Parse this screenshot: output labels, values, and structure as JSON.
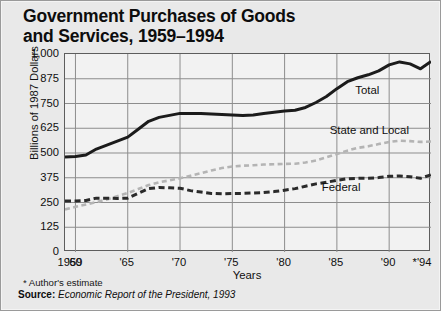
{
  "title": "Government Purchases of Goods\nand Services, 1959–1994",
  "footnote": "* Author's estimate",
  "source": {
    "key": "Source:",
    "value": "Economic Report of the President, 1993"
  },
  "labels": {
    "total": "Total",
    "state_and_local": "State and Local",
    "federal": "Federal"
  },
  "colors": {
    "total": "#1b1b1b",
    "state_and_local": "#b4b4b4",
    "federal": "#2a2a2a",
    "grid": "#8d8d8d",
    "frame": "#5d5d5d",
    "panel": "#e9e9e9",
    "plot": "#f2f2f2"
  },
  "chart_data": {
    "type": "line",
    "title": "Government Purchases of Goods and Services, 1959–1994",
    "xlabel": "Years",
    "ylabel": "Billions of 1987 Dollars",
    "ylim": [
      0,
      1000
    ],
    "yticks": [
      "0",
      "125",
      "250",
      "375",
      "500",
      "625",
      "750",
      "875",
      "1,000"
    ],
    "ytick_values": [
      0,
      125,
      250,
      375,
      500,
      625,
      750,
      875,
      1000
    ],
    "xlim": [
      1959,
      1994
    ],
    "xticks": [
      "1959",
      "'60",
      "'65",
      "'70",
      "'75",
      "'80",
      "'85",
      "'90",
      "*'94"
    ],
    "xtick_values": [
      1959,
      1960,
      1965,
      1970,
      1975,
      1980,
      1985,
      1990,
      1994
    ],
    "grid": true,
    "legend": "inline-labels",
    "x": [
      1959,
      1960,
      1961,
      1962,
      1963,
      1964,
      1965,
      1966,
      1967,
      1968,
      1969,
      1970,
      1971,
      1972,
      1973,
      1974,
      1975,
      1976,
      1977,
      1978,
      1979,
      1980,
      1981,
      1982,
      1983,
      1984,
      1985,
      1986,
      1987,
      1988,
      1989,
      1990,
      1991,
      1992,
      1993,
      1994
    ],
    "series": [
      {
        "name": "Total",
        "style": "solid",
        "values": [
          480,
          482,
          490,
          520,
          540,
          560,
          580,
          620,
          660,
          680,
          690,
          700,
          700,
          700,
          697,
          695,
          692,
          690,
          692,
          700,
          706,
          712,
          716,
          730,
          755,
          785,
          825,
          860,
          880,
          895,
          915,
          945,
          960,
          950,
          925,
          962
        ]
      },
      {
        "name": "State and Local",
        "style": "dashed-light",
        "values": [
          215,
          228,
          240,
          252,
          265,
          282,
          298,
          318,
          338,
          352,
          362,
          372,
          385,
          398,
          412,
          424,
          432,
          436,
          438,
          442,
          443,
          445,
          446,
          452,
          462,
          478,
          495,
          512,
          526,
          534,
          545,
          556,
          562,
          560,
          556,
          558
        ]
      },
      {
        "name": "Federal",
        "style": "dashed-dark",
        "values": [
          258,
          258,
          260,
          272,
          272,
          270,
          272,
          296,
          320,
          326,
          324,
          322,
          310,
          303,
          296,
          294,
          296,
          296,
          298,
          300,
          305,
          312,
          320,
          332,
          344,
          352,
          362,
          370,
          372,
          372,
          376,
          382,
          384,
          380,
          372,
          390
        ]
      }
    ],
    "annotations": [
      {
        "text": "Total",
        "x": 1988,
        "y": 815
      },
      {
        "text": "State and Local",
        "x": 1988.2,
        "y": 610
      },
      {
        "text": "Federal",
        "x": 1985.5,
        "y": 322
      }
    ]
  }
}
